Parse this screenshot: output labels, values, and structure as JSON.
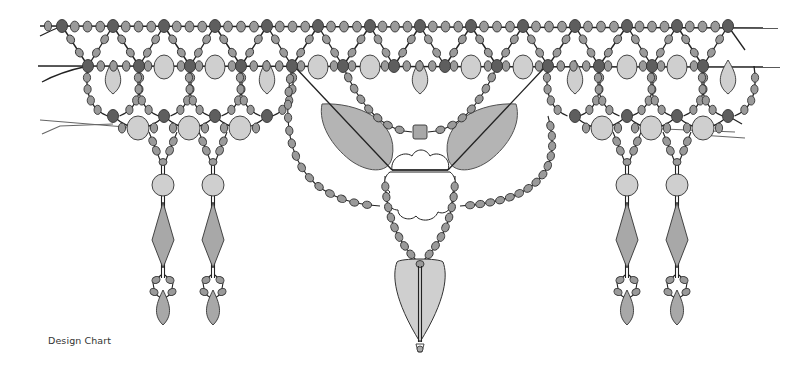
{
  "caption": "Design Chart",
  "colors": {
    "seed_bead": "#9a9a9a",
    "seed_bead_dark": "#5e5e5e",
    "accent_light": "#cfcfcf",
    "drop_mid": "#a8a8a8",
    "thread": "#222222",
    "thread_grey": "#666666",
    "outline": "#333333",
    "background": "#ffffff"
  },
  "diagram": {
    "top_line_y": 26,
    "second_line_y": 66,
    "top_line_x": [
      40,
      778
    ],
    "second_line_x": [
      38,
      780
    ],
    "top_dark_nodes_x": [
      62,
      113,
      164,
      215,
      267,
      318,
      370,
      420,
      471,
      523,
      575,
      627,
      677,
      728
    ],
    "second_dark_nodes_x": [
      88,
      139,
      190,
      241,
      292,
      343,
      394,
      445,
      497,
      548,
      599,
      652,
      703
    ],
    "big_ovals_row2_x": [
      164,
      215,
      318,
      370,
      471,
      523,
      627,
      677
    ],
    "drops_row2_x": [
      113,
      267,
      420,
      575,
      728
    ],
    "lower_dark_nodes": [
      {
        "x": 113,
        "y": 116
      },
      {
        "x": 164,
        "y": 116
      },
      {
        "x": 215,
        "y": 116
      },
      {
        "x": 267,
        "y": 116
      },
      {
        "x": 575,
        "y": 116
      },
      {
        "x": 627,
        "y": 116
      },
      {
        "x": 677,
        "y": 116
      },
      {
        "x": 728,
        "y": 116
      }
    ],
    "lower_ovals": [
      {
        "x": 138,
        "y": 128
      },
      {
        "x": 189,
        "y": 128
      },
      {
        "x": 240,
        "y": 128
      },
      {
        "x": 602,
        "y": 128
      },
      {
        "x": 651,
        "y": 128
      },
      {
        "x": 703,
        "y": 128
      }
    ],
    "dangles_x": [
      163,
      213,
      627,
      677
    ],
    "center": {
      "leaf_left": {
        "cx": 352,
        "cy": 132
      },
      "leaf_right": {
        "cx": 488,
        "cy": 132
      },
      "flower": {
        "cx": 420,
        "cy": 187
      },
      "cube": {
        "x": 420,
        "y": 132
      },
      "pendant": {
        "cx": 420,
        "cy": 296
      },
      "end_bead_y": 348
    }
  }
}
